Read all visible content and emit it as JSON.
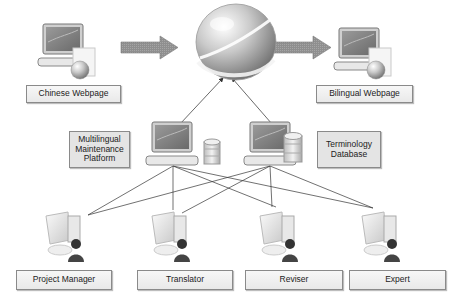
{
  "diagram": {
    "nodes": {
      "source_page": {
        "label": "Chinese Webpage",
        "icon": "computer-with-web-document-icon"
      },
      "internet": {
        "icon": "globe-icon"
      },
      "target_page": {
        "label": "Bilingual Webpage",
        "icon": "computer-with-web-document-icon"
      },
      "platform": {
        "label": "Multilingual\nMaintenance\nPlatform",
        "icon": "server-computer-with-database-icon"
      },
      "termbase": {
        "label": "Terminology\nDatabase",
        "icon": "server-computer-with-database-icon"
      },
      "users": [
        {
          "label": "Project Manager",
          "icon": "user-workstation-icon"
        },
        {
          "label": "Translator",
          "icon": "user-workstation-icon"
        },
        {
          "label": "Reviser",
          "icon": "user-workstation-icon"
        },
        {
          "label": "Expert",
          "icon": "user-workstation-icon"
        }
      ]
    },
    "edges": [
      {
        "from": "source_page",
        "to": "internet",
        "style": "block-arrow"
      },
      {
        "from": "internet",
        "to": "target_page",
        "style": "block-arrow"
      },
      {
        "from": "platform",
        "to": "internet",
        "style": "thin-arrow"
      },
      {
        "from": "termbase",
        "to": "internet",
        "style": "thin-arrow"
      },
      {
        "from": "platform",
        "to": "Project Manager",
        "style": "line"
      },
      {
        "from": "platform",
        "to": "Translator",
        "style": "line"
      },
      {
        "from": "platform",
        "to": "Reviser",
        "style": "line"
      },
      {
        "from": "platform",
        "to": "Expert",
        "style": "line"
      },
      {
        "from": "termbase",
        "to": "Project Manager",
        "style": "line"
      },
      {
        "from": "termbase",
        "to": "Translator",
        "style": "line"
      },
      {
        "from": "termbase",
        "to": "Reviser",
        "style": "line"
      },
      {
        "from": "termbase",
        "to": "Expert",
        "style": "line"
      }
    ],
    "colors": {
      "block_arrow": "#8c8c8c",
      "line": "#333333",
      "label_border": "#8a8a8a",
      "label_fill": "#eeeeee"
    }
  }
}
